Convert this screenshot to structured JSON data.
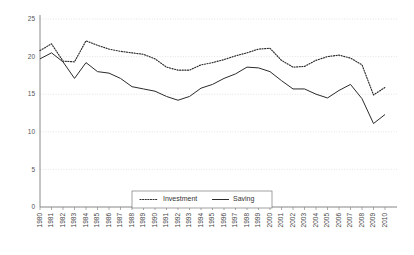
{
  "chart_data": {
    "type": "line",
    "title": "",
    "subtitle": "",
    "xlabel": "",
    "ylabel": "",
    "grid": true,
    "legend_position": "bottom-center",
    "xlim": [
      1980,
      2010
    ],
    "ylim": [
      0,
      25
    ],
    "yticks": [
      0,
      5,
      10,
      15,
      20,
      25
    ],
    "ytick_labels": [
      "0",
      "5",
      "10",
      "15",
      "20",
      "25"
    ],
    "categories": [
      "1980",
      "1981",
      "1982",
      "1983",
      "1984",
      "1985",
      "1986",
      "1987",
      "1988",
      "1989",
      "1990",
      "1991",
      "1992",
      "1993",
      "1994",
      "1995",
      "1996",
      "1997",
      "1998",
      "1999",
      "2000",
      "2001",
      "2002",
      "2003",
      "2004",
      "2005",
      "2006",
      "2007",
      "2008",
      "2009",
      "2010"
    ],
    "series": [
      {
        "name": "Investment",
        "style": "dotted",
        "color": "#2b2b2b",
        "values": [
          20.8,
          21.7,
          19.4,
          19.3,
          22.1,
          21.5,
          21.0,
          20.7,
          20.5,
          20.3,
          19.7,
          18.6,
          18.2,
          18.2,
          18.9,
          19.2,
          19.6,
          20.1,
          20.5,
          21.0,
          21.1,
          19.5,
          18.6,
          18.7,
          19.5,
          20.0,
          20.2,
          19.8,
          18.9,
          14.9,
          15.9
        ]
      },
      {
        "name": "Saving",
        "style": "solid",
        "color": "#2b2b2b",
        "values": [
          19.7,
          20.5,
          19.3,
          17.1,
          19.2,
          18.0,
          17.8,
          17.1,
          16.0,
          15.7,
          15.4,
          14.7,
          14.2,
          14.7,
          15.8,
          16.3,
          17.1,
          17.7,
          18.6,
          18.5,
          18.0,
          16.8,
          15.7,
          15.7,
          15.0,
          14.5,
          15.5,
          16.3,
          14.4,
          11.1,
          12.3
        ]
      }
    ]
  },
  "legend": {
    "items": [
      {
        "label": "Investment",
        "style": "dotted"
      },
      {
        "label": "Saving",
        "style": "solid"
      }
    ]
  }
}
